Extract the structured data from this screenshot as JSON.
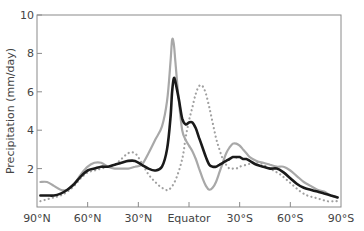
{
  "chart_data": {
    "type": "line",
    "title": "",
    "xlabel": "",
    "ylabel": "Precipitation (mm/day)",
    "ylim": [
      0,
      10
    ],
    "xlim": [
      90,
      -90
    ],
    "grid": false,
    "legend": null,
    "x_ticks": [
      {
        "lat": 90,
        "label": "90°N"
      },
      {
        "lat": 60,
        "label": "60°N"
      },
      {
        "lat": 30,
        "label": "30°N"
      },
      {
        "lat": 0,
        "label": "Equator"
      },
      {
        "lat": -30,
        "label": "30°S"
      },
      {
        "lat": -60,
        "label": "60°S"
      },
      {
        "lat": -90,
        "label": "90°S"
      }
    ],
    "y_ticks": [
      2,
      4,
      6,
      8,
      10
    ],
    "series": [
      {
        "name": "grey-solid",
        "style": "solid",
        "color": "#a8a8a8",
        "x": [
          88,
          84,
          80,
          76,
          72,
          68,
          64,
          60,
          56,
          52,
          48,
          44,
          40,
          36,
          32,
          28,
          24,
          20,
          16,
          13,
          11,
          10,
          9,
          8,
          6,
          4,
          2,
          0,
          -2,
          -4,
          -6,
          -8,
          -10,
          -12,
          -14,
          -16,
          -18,
          -20,
          -22,
          -24,
          -26,
          -28,
          -30,
          -32,
          -34,
          -36,
          -40,
          -44,
          -48,
          -52,
          -56,
          -60,
          -64,
          -68,
          -72,
          -76,
          -80,
          -84,
          -88
        ],
        "values": [
          1.3,
          1.3,
          1.1,
          0.9,
          0.9,
          1.2,
          1.7,
          2.1,
          2.3,
          2.3,
          2.1,
          2.0,
          2.0,
          2.0,
          2.1,
          2.2,
          2.8,
          3.5,
          4.2,
          5.5,
          7.5,
          8.7,
          8.5,
          7.5,
          5.5,
          4.0,
          3.5,
          3.2,
          2.9,
          2.5,
          2.0,
          1.5,
          1.1,
          0.9,
          1.0,
          1.3,
          1.8,
          2.3,
          2.8,
          3.1,
          3.3,
          3.3,
          3.2,
          3.0,
          2.8,
          2.6,
          2.4,
          2.3,
          2.2,
          2.1,
          2.1,
          1.9,
          1.6,
          1.3,
          1.1,
          0.9,
          0.8,
          0.6,
          0.5
        ]
      },
      {
        "name": "black-solid",
        "style": "solid",
        "color": "#1a1a1a",
        "x": [
          88,
          84,
          80,
          76,
          72,
          68,
          64,
          60,
          56,
          52,
          48,
          44,
          40,
          36,
          32,
          28,
          24,
          20,
          16,
          13,
          11,
          10,
          9,
          8,
          6,
          4,
          2,
          0,
          -2,
          -4,
          -6,
          -8,
          -10,
          -12,
          -14,
          -16,
          -18,
          -20,
          -22,
          -24,
          -26,
          -28,
          -30,
          -32,
          -34,
          -36,
          -40,
          -44,
          -48,
          -52,
          -56,
          -60,
          -64,
          -68,
          -72,
          -76,
          -80,
          -84,
          -88
        ],
        "values": [
          0.6,
          0.6,
          0.6,
          0.7,
          0.9,
          1.2,
          1.6,
          1.9,
          2.0,
          2.1,
          2.1,
          2.2,
          2.3,
          2.4,
          2.4,
          2.2,
          2.0,
          1.9,
          2.1,
          3.0,
          4.6,
          6.0,
          6.7,
          6.5,
          5.6,
          4.6,
          4.3,
          4.4,
          4.4,
          4.1,
          3.6,
          3.1,
          2.6,
          2.2,
          2.1,
          2.1,
          2.2,
          2.3,
          2.4,
          2.5,
          2.6,
          2.6,
          2.6,
          2.5,
          2.5,
          2.4,
          2.2,
          2.1,
          2.0,
          2.0,
          1.8,
          1.5,
          1.2,
          1.0,
          0.9,
          0.8,
          0.7,
          0.6,
          0.5
        ]
      },
      {
        "name": "grey-dotted",
        "style": "dotted",
        "color": "#a0a0a0",
        "x": [
          88,
          84,
          80,
          76,
          72,
          68,
          64,
          60,
          56,
          52,
          48,
          44,
          40,
          36,
          32,
          28,
          24,
          20,
          16,
          12,
          8,
          4,
          2,
          0,
          -2,
          -4,
          -6,
          -8,
          -10,
          -12,
          -14,
          -16,
          -18,
          -20,
          -22,
          -24,
          -26,
          -28,
          -30,
          -34,
          -38,
          -42,
          -46,
          -50,
          -54,
          -58,
          -62,
          -66,
          -70,
          -74,
          -78,
          -82,
          -86,
          -88
        ],
        "values": [
          0.3,
          0.4,
          0.5,
          0.6,
          0.8,
          1.1,
          1.5,
          1.8,
          1.9,
          2.0,
          2.1,
          2.2,
          2.5,
          2.8,
          2.8,
          2.3,
          1.7,
          1.3,
          1.0,
          0.9,
          1.4,
          2.5,
          3.6,
          4.5,
          5.2,
          5.9,
          6.3,
          6.3,
          5.9,
          5.2,
          4.4,
          3.6,
          3.0,
          2.5,
          2.2,
          2.0,
          2.0,
          2.0,
          2.1,
          2.2,
          2.3,
          2.3,
          2.1,
          1.9,
          1.7,
          1.4,
          1.1,
          0.8,
          0.6,
          0.5,
          0.4,
          0.3,
          0.3,
          0.3
        ]
      }
    ]
  }
}
